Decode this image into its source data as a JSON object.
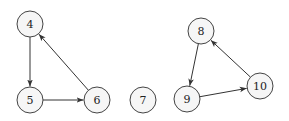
{
  "diagram": {
    "type": "directed-graph",
    "node_radius": 13,
    "colors": {
      "node_fill": "#f6f6f6",
      "node_stroke": "#444444",
      "edge": "#333333",
      "label": "#222222"
    },
    "nodes": [
      {
        "id": "4",
        "label": "4",
        "x": 30,
        "y": 24
      },
      {
        "id": "5",
        "label": "5",
        "x": 30,
        "y": 100
      },
      {
        "id": "6",
        "label": "6",
        "x": 97,
        "y": 100
      },
      {
        "id": "7",
        "label": "7",
        "x": 143,
        "y": 100
      },
      {
        "id": "8",
        "label": "8",
        "x": 201,
        "y": 31
      },
      {
        "id": "9",
        "label": "9",
        "x": 187,
        "y": 99
      },
      {
        "id": "10",
        "label": "10",
        "x": 260,
        "y": 86
      }
    ],
    "edges": [
      {
        "from": "4",
        "to": "5"
      },
      {
        "from": "5",
        "to": "6"
      },
      {
        "from": "6",
        "to": "4"
      },
      {
        "from": "8",
        "to": "9"
      },
      {
        "from": "9",
        "to": "10"
      },
      {
        "from": "10",
        "to": "8"
      }
    ]
  }
}
